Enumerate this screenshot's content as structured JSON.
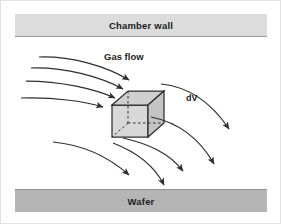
{
  "figure": {
    "type": "schematic-diagram",
    "background_color": "#ffffff",
    "border_color": "#e2e2e2"
  },
  "chamber_wall": {
    "label": "Chamber wall",
    "fill_color": "#dcdcdc",
    "edge_color": "#9a9a9a",
    "position": "top"
  },
  "wafer": {
    "label": "Wafer",
    "fill_color": "#b5b5b5",
    "edge_color": "#8d8d8d",
    "position": "bottom"
  },
  "labels": {
    "gas_flow": "Gas flow",
    "control_volume": "dV"
  },
  "control_volume": {
    "name": "dV",
    "shape": "cube",
    "fill_color": "#d8d8d8",
    "top_face_color": "#cfcfcf",
    "side_face_color": "#c4c4c4",
    "stroke_color": "#3a3a3a",
    "hidden_edge_style": "dashed"
  },
  "flow_arrows": {
    "stroke_color": "#2e2e2e",
    "style": "curved streamlines with arrowheads",
    "direction": "left to right, curving downward toward the wafer",
    "count_left_of_cube": 5,
    "count_right_of_cube": 4
  }
}
